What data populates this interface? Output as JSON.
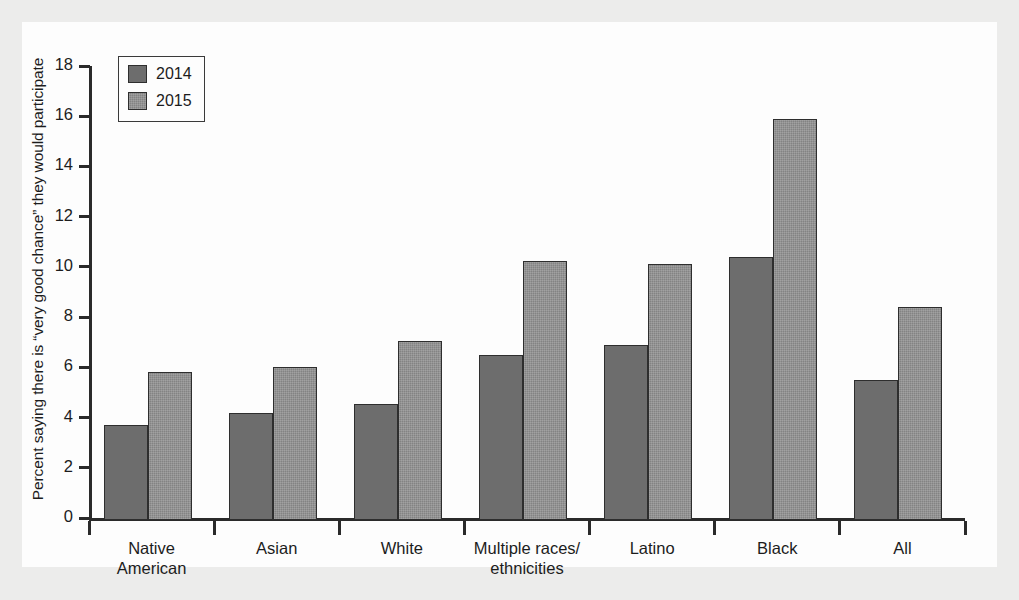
{
  "chart_data": {
    "type": "bar",
    "title": "",
    "xlabel": "",
    "ylabel": "Percent saying there is “very good chance” they would participate",
    "categories": [
      "Native American",
      "Asian",
      "White",
      "Multiple races/ethnicities",
      "Latino",
      "Black",
      "All"
    ],
    "category_lines": [
      [
        "Native",
        "American"
      ],
      [
        "Asian",
        ""
      ],
      [
        "White",
        ""
      ],
      [
        "Multiple races/",
        "ethnicities"
      ],
      [
        "Latino",
        ""
      ],
      [
        "Black",
        ""
      ],
      [
        "All",
        ""
      ]
    ],
    "series": [
      {
        "name": "2014",
        "color": "#6d6d6d",
        "values": [
          3.7,
          4.2,
          4.55,
          6.5,
          6.9,
          10.4,
          5.5
        ]
      },
      {
        "name": "2015",
        "color": "#838383",
        "values": [
          5.8,
          6.0,
          7.05,
          10.25,
          10.1,
          15.9,
          8.4
        ]
      }
    ],
    "ylim": [
      0,
      18
    ],
    "yticks": [
      0,
      2,
      4,
      6,
      8,
      10,
      12,
      14,
      16,
      18
    ],
    "ytick_labels": [
      "0",
      "2",
      "4",
      "6",
      "8",
      "10",
      "12",
      "14",
      "16",
      "18"
    ],
    "grid": false,
    "legend_position": "top-left"
  },
  "legend": {
    "entries": [
      {
        "label": "2014"
      },
      {
        "label": "2015"
      }
    ]
  },
  "colors": {
    "series_2014": "#6d6d6d",
    "series_2015": "#838383",
    "axis": "#2a2a2a",
    "text": "#1c1c1c",
    "paper": "#fdfdfd",
    "page_margin": "#ececeb"
  }
}
